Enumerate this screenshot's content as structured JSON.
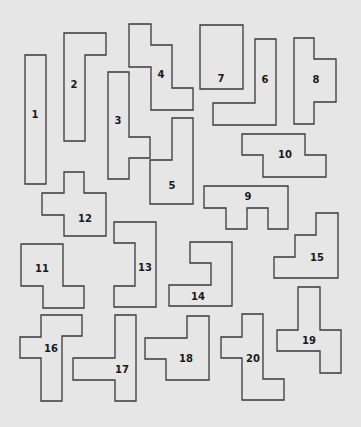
{
  "diagram": {
    "background": "#e6e6e6",
    "stroke": "#3a3a3a",
    "pieces": [
      {
        "id": "1",
        "label": "1",
        "points": "25,55 46,55 46,184 25,184",
        "lx": 35,
        "ly": 115
      },
      {
        "id": "2",
        "label": "2",
        "points": "64,33 106,33 106,55 85,55 85,141 64,141",
        "lx": 74,
        "ly": 85
      },
      {
        "id": "3",
        "label": "3",
        "points": "108,72 129,72 129,137 150,137 150,158 129,158 129,179 108,179",
        "lx": 118,
        "ly": 121
      },
      {
        "id": "4",
        "label": "4",
        "points": "129,24 151,24 151,45 172,45 172,88 193,88 193,110 151,110 151,67 129,67",
        "lx": 161,
        "ly": 75
      },
      {
        "id": "5",
        "label": "5",
        "points": "172,118 193,118 193,204 150,204 150,160 172,160",
        "lx": 172,
        "ly": 186
      },
      {
        "id": "6",
        "label": "6",
        "points": "255,39 276,39 276,125 213,125 213,103 255,103",
        "lx": 265,
        "ly": 80
      },
      {
        "id": "7",
        "label": "7",
        "points": "200,25 243,25 243,89 200,89",
        "lx": 221,
        "ly": 79
      },
      {
        "id": "8",
        "label": "8",
        "points": "294,38 314,38 314,59 336,59 336,102 314,102 314,124 294,124",
        "lx": 316,
        "ly": 80
      },
      {
        "id": "9",
        "label": "9",
        "points": "204,186 288,186 288,229 268,229 268,208 247,208 247,229 226,229 226,208 204,208",
        "lx": 248,
        "ly": 197
      },
      {
        "id": "10",
        "label": "10",
        "points": "242,134 305,134 305,155 326,155 326,177 263,177 263,155 242,155",
        "lx": 285,
        "ly": 155
      },
      {
        "id": "11",
        "label": "11",
        "points": "21,244 63,244 63,286 84,286 84,308 43,308 43,286 21,286",
        "lx": 42,
        "ly": 269
      },
      {
        "id": "12",
        "label": "12",
        "points": "64,172 84,172 84,193 106,193 106,236 64,236 64,215 42,215 42,193 64,193",
        "lx": 85,
        "ly": 219
      },
      {
        "id": "13",
        "label": "13",
        "points": "114,222 156,222 156,307 114,307 114,286 135,286 135,243 114,243",
        "lx": 145,
        "ly": 268
      },
      {
        "id": "14",
        "label": "14",
        "points": "190,242 232,242 232,306 169,306 169,285 211,285 211,263 190,263",
        "lx": 198,
        "ly": 297
      },
      {
        "id": "15",
        "label": "15",
        "points": "316,213 338,213 338,278 274,278 274,257 295,257 295,235 316,235",
        "lx": 317,
        "ly": 258
      },
      {
        "id": "16",
        "label": "16",
        "points": "41,315 82,315 82,336 62,336 62,401 41,401 41,358 20,358 20,337 41,337",
        "lx": 51,
        "ly": 349
      },
      {
        "id": "17",
        "label": "17",
        "points": "115,315 136,315 136,401 115,401 115,380 73,380 73,358 115,358",
        "lx": 122,
        "ly": 370
      },
      {
        "id": "18",
        "label": "18",
        "points": "187,316 209,316 209,380 166,380 166,359 145,359 145,338 187,338",
        "lx": 186,
        "ly": 359
      },
      {
        "id": "19",
        "label": "19",
        "points": "298,287 320,287 320,330 341,330 341,373 320,373 320,351 277,351 277,330 298,330",
        "lx": 309,
        "ly": 341
      },
      {
        "id": "20",
        "label": "20",
        "points": "242,314 263,314 263,379 284,379 284,400 242,400 242,358 221,358 221,337 242,337",
        "lx": 253,
        "ly": 359
      }
    ]
  }
}
